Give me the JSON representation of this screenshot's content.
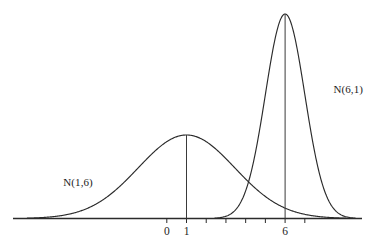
{
  "chart_data": {
    "type": "line",
    "title": "",
    "subtitle": "",
    "xlabel": "",
    "ylabel": "",
    "grid": false,
    "legend_position": "inline-annotation",
    "background_color": "#ffffff",
    "stroke_color": "#2b2b2b",
    "axis": {
      "show_y_axis": false,
      "show_x_axis": true,
      "x_min": -7.8,
      "x_max": 9.9,
      "x_tick_values": [
        0,
        1,
        2,
        3,
        4,
        5,
        6,
        7
      ],
      "x_tick_labels": [
        "0",
        "1",
        "",
        "",
        "",
        "",
        "6",
        ""
      ],
      "visible_tick_labels": [
        "0",
        "1",
        "6"
      ],
      "y_min": 0,
      "y_max": 0.41
    },
    "series": [
      {
        "name": "N(1,6)",
        "label": "N(1,6)",
        "distribution": "normal",
        "mean": 1,
        "variance": 6,
        "std_dev": 2.449,
        "peak_x": 1,
        "peak_y": 0.1629,
        "relative_peak_height": 0.408,
        "has_drop_line": true,
        "label_position": {
          "x": 1.0,
          "y": 0.0
        },
        "description": "wide flat bell curve centered at 1"
      },
      {
        "name": "N(6,1)",
        "label": "N(6,1)",
        "distribution": "normal",
        "mean": 6,
        "variance": 1,
        "std_dev": 1.0,
        "peak_x": 6,
        "peak_y": 0.3989,
        "relative_peak_height": 1.0,
        "has_drop_line": true,
        "label_position": {
          "x": 8.1,
          "y": 0.0
        },
        "description": "narrow tall bell curve centered at 6"
      }
    ],
    "annotations": [
      {
        "text": "N(1,6)",
        "name": "label-wide-curve"
      },
      {
        "text": "N(6,1)",
        "name": "label-narrow-curve"
      }
    ]
  },
  "labels": {
    "wide_curve": "N(1,6)",
    "narrow_curve": "N(6,1)"
  },
  "ticks": {
    "zero": "0",
    "one": "1",
    "six": "6"
  }
}
